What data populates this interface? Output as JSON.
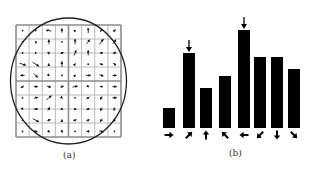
{
  "figure": {
    "panel_a": {
      "caption": "(a)",
      "caption_pos": [
        63,
        150
      ],
      "grid": {
        "x0": 16,
        "y0": 25,
        "x1": 121,
        "y1": 137,
        "rows": 8,
        "cols": 8,
        "thin_color": "#a8a8a8",
        "thick_color": "#8c8c8c",
        "thick_every": 4
      },
      "circle": {
        "cx": 68.5,
        "cy": 81,
        "rx": 58,
        "ry": 63,
        "color": "#222222"
      },
      "gradient_arrows": [
        [
          [
            0,
            0
          ],
          [
            0,
            0
          ],
          [
            -5,
            -1
          ],
          [
            0,
            -4
          ],
          [
            1,
            -1
          ],
          [
            0,
            -5
          ],
          [
            2,
            -3
          ],
          [
            2,
            -2
          ]
        ],
        [
          [
            0,
            0
          ],
          [
            -1,
            -1
          ],
          [
            0,
            -4
          ],
          [
            0,
            0
          ],
          [
            0,
            -5
          ],
          [
            3,
            -4
          ],
          [
            4,
            -5
          ],
          [
            3,
            -4
          ]
        ],
        [
          [
            0,
            0
          ],
          [
            0,
            0
          ],
          [
            2,
            -1
          ],
          [
            3,
            -1
          ],
          [
            2,
            -5
          ],
          [
            0,
            -5
          ],
          [
            3,
            -1
          ],
          [
            3,
            -2
          ]
        ],
        [
          [
            6,
            2
          ],
          [
            6,
            4
          ],
          [
            0,
            -1
          ],
          [
            0,
            -5
          ],
          [
            1,
            -1
          ],
          [
            0,
            0
          ],
          [
            3,
            1
          ],
          [
            3,
            2
          ]
        ],
        [
          [
            -4,
            0
          ],
          [
            4,
            4
          ],
          [
            1,
            1
          ],
          [
            0,
            0
          ],
          [
            1,
            -1
          ],
          [
            5,
            0
          ],
          [
            4,
            1
          ],
          [
            4,
            0
          ]
        ],
        [
          [
            -3,
            2
          ],
          [
            4,
            0
          ],
          [
            4,
            1
          ],
          [
            3,
            -1
          ],
          [
            5,
            -1
          ],
          [
            1,
            1
          ],
          [
            3,
            0
          ],
          [
            4,
            0
          ]
        ],
        [
          [
            0,
            0
          ],
          [
            4,
            -1
          ],
          [
            5,
            -4
          ],
          [
            1,
            1
          ],
          [
            0,
            0
          ],
          [
            -3,
            2
          ],
          [
            -2,
            3
          ],
          [
            4,
            0
          ]
        ],
        [
          [
            1,
            1
          ],
          [
            4,
            0
          ],
          [
            2,
            -3
          ],
          [
            2,
            1
          ],
          [
            -2,
            2
          ],
          [
            -3,
            1
          ],
          [
            -2,
            3
          ],
          [
            -1,
            3
          ]
        ],
        [
          [
            0,
            0
          ],
          [
            6,
            3
          ],
          [
            3,
            -1
          ],
          [
            0,
            -1
          ],
          [
            -3,
            1
          ],
          [
            -3,
            1
          ],
          [
            -2,
            3
          ],
          [
            -2,
            3
          ]
        ],
        [
          [
            0,
            0
          ],
          [
            3,
            1
          ],
          [
            2,
            1
          ],
          [
            1,
            2
          ],
          [
            0,
            0
          ],
          [
            -3,
            0
          ],
          [
            4,
            1
          ],
          [
            0,
            0
          ]
        ]
      ]
    },
    "panel_b": {
      "caption": "(b)",
      "caption_pos": [
        229,
        148
      ],
      "baseline_y": 128,
      "bar_width": 12,
      "bar_color": "#000000",
      "bars": [
        {
          "x": 163,
          "height": 20,
          "direction": "right",
          "angle_deg": 0,
          "peak": false
        },
        {
          "x": 183,
          "height": 75,
          "direction": "up-right",
          "angle_deg": 45,
          "peak": true
        },
        {
          "x": 200,
          "height": 40,
          "direction": "up",
          "angle_deg": 90,
          "peak": false
        },
        {
          "x": 219,
          "height": 52,
          "direction": "up-left",
          "angle_deg": 135,
          "peak": false
        },
        {
          "x": 238,
          "height": 98,
          "direction": "left",
          "angle_deg": 180,
          "peak": true
        },
        {
          "x": 254,
          "height": 71,
          "direction": "down-left",
          "angle_deg": 225,
          "peak": false
        },
        {
          "x": 271,
          "height": 71,
          "direction": "down",
          "angle_deg": 270,
          "peak": false
        },
        {
          "x": 288,
          "height": 59,
          "direction": "down-right",
          "angle_deg": 315,
          "peak": false
        }
      ]
    }
  },
  "chart_data": {
    "type": "bar",
    "title": "",
    "xlabel": "",
    "ylabel": "",
    "categories": [
      "0°",
      "45°",
      "90°",
      "135°",
      "180°",
      "225°",
      "270°",
      "315°"
    ],
    "category_icons": [
      "arrow-right",
      "arrow-up-right",
      "arrow-up",
      "arrow-up-left",
      "arrow-left",
      "arrow-down-left",
      "arrow-down",
      "arrow-down-right"
    ],
    "values": [
      20,
      75,
      40,
      52,
      98,
      71,
      71,
      59
    ],
    "annotations": [
      {
        "category": "45°",
        "marker": "down-arrow above bar (peak)"
      },
      {
        "category": "180°",
        "marker": "down-arrow above bar (peak)"
      }
    ],
    "grid": false,
    "legend": null,
    "caption": "(b)"
  }
}
